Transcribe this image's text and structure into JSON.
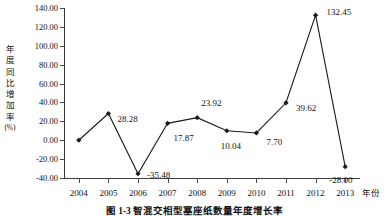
{
  "chart_data": {
    "type": "line",
    "title": "",
    "caption": "图 1-3  智混交相型塞座纸数量年度增长率",
    "xlabel": "年份",
    "ylabel": "年度同比增加率",
    "ylabel_unit": "(%)",
    "ylabel_chars": [
      "年",
      "度",
      "同",
      "比",
      "增",
      "加",
      "率"
    ],
    "categories": [
      "2004",
      "2005",
      "2006",
      "2007",
      "2008",
      "2009",
      "2010",
      "2011",
      "2012",
      "2013"
    ],
    "values": [
      0.0,
      28.28,
      -35.48,
      17.87,
      23.92,
      10.04,
      7.7,
      39.62,
      132.45,
      -28.0
    ],
    "point_labels": [
      "",
      "28.28",
      "-35.48",
      "17.87",
      "23.92",
      "10.04",
      "7.70",
      "39.62",
      "132.45",
      "-28.00"
    ],
    "ylim": [
      -40,
      140
    ],
    "yticks": [
      140.0,
      120.0,
      100.0,
      80.0,
      60.0,
      40.0,
      20.0,
      0.0,
      -20.0,
      -40.0
    ],
    "ytick_labels": [
      "140.00",
      "120.00",
      "100.00",
      "80.00",
      "60.00",
      "40.00",
      "20.00",
      "0.00",
      "-20.00",
      "-40.00"
    ],
    "grid": false,
    "legend": "none",
    "series_color": "#1a1a1a",
    "marker": "diamond",
    "label_offsets": [
      {
        "dx": 0,
        "dy": 0,
        "show": false
      },
      {
        "dx": 9,
        "dy": 6,
        "show": true
      },
      {
        "dx": 9,
        "dy": 2,
        "show": true
      },
      {
        "dx": 6,
        "dy": 16,
        "show": true
      },
      {
        "dx": 4,
        "dy": -14,
        "show": true
      },
      {
        "dx": -6,
        "dy": 16,
        "show": true
      },
      {
        "dx": 10,
        "dy": 10,
        "show": true
      },
      {
        "dx": 10,
        "dy": 6,
        "show": true
      },
      {
        "dx": 11,
        "dy": -2,
        "show": true
      },
      {
        "dx": -16,
        "dy": 14,
        "show": true
      }
    ]
  }
}
